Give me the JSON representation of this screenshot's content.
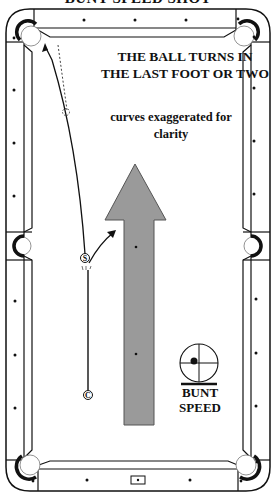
{
  "title": "BUNT SPEED SHOT",
  "annotations": {
    "headline_line1": "THE BALL TURNS IN",
    "headline_line2": "THE LAST FOOT OR TWO",
    "note_line1": "curves exaggerated for",
    "note_line2": "clarity"
  },
  "balls": {
    "cue_ball_label": "C",
    "object_ball_label": "S"
  },
  "speed_indicator": {
    "line1": "BUNT",
    "line2": "SPEED",
    "tip_position": "slightly left of center"
  },
  "colors": {
    "line": "#111111",
    "arrow_fill": "#9a9a9a",
    "arrow_stroke": "#555555",
    "background": "#ffffff"
  },
  "table": {
    "pockets": [
      "top-left",
      "top-right",
      "side-left",
      "side-right",
      "bottom-left",
      "bottom-right"
    ],
    "diamonds_per_rail_segment": 3
  }
}
